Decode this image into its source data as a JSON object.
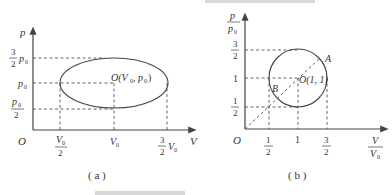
{
  "figure_a": {
    "caption": "( a )",
    "y_axis_label": "p",
    "x_axis_label": "V",
    "origin_label": "O",
    "y_ticks": [
      {
        "num": "3",
        "den": "2",
        "suffix": "p",
        "sub": "0"
      },
      {
        "text": "p",
        "sub": "0"
      },
      {
        "num": "p",
        "num_sub": "0",
        "den": "2"
      }
    ],
    "x_ticks": [
      {
        "num": "V",
        "num_sub": "0",
        "den": "2"
      },
      {
        "text": "V",
        "sub": "0"
      },
      {
        "num": "3",
        "den": "2",
        "suffix": "V",
        "sub": "0"
      }
    ],
    "center_label": "O(V",
    "center_label_sub1": "0",
    "center_label_mid": ", p",
    "center_label_sub2": "0",
    "center_label_end": ")",
    "shape": "ellipse"
  },
  "figure_b": {
    "caption": "( b )",
    "y_axis_label_num": "p",
    "y_axis_label_den": "p",
    "y_axis_label_den_sub": "0",
    "x_axis_label_num": "V",
    "x_axis_label_den": "V",
    "x_axis_label_den_sub": "0",
    "origin_label": "O",
    "y_ticks": [
      {
        "num": "3",
        "den": "2"
      },
      {
        "text": "1"
      },
      {
        "num": "1",
        "den": "2"
      }
    ],
    "x_ticks": [
      {
        "num": "1",
        "den": "2"
      },
      {
        "text": "1"
      },
      {
        "num": "3",
        "den": "2"
      }
    ],
    "center_label": "O(1, 1)",
    "point_a": "A",
    "point_b": "B",
    "shape": "circle"
  }
}
